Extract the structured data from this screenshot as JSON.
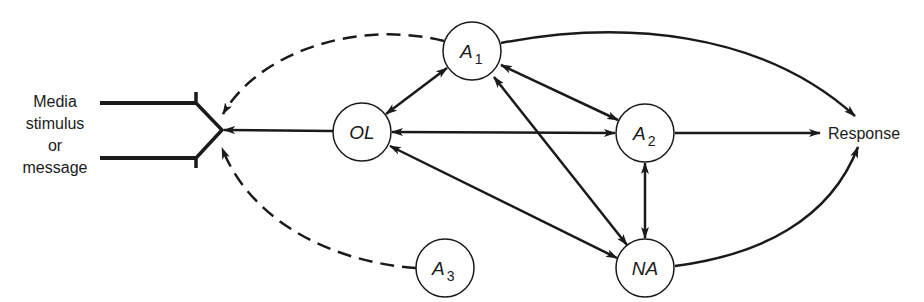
{
  "diagram": {
    "input": {
      "lines": [
        "Media",
        "stimulus",
        "or",
        "message"
      ]
    },
    "output": {
      "label": "Response"
    },
    "nodes": {
      "A1": {
        "main": "A",
        "sub": "1"
      },
      "OL": {
        "main": "OL",
        "sub": ""
      },
      "A2": {
        "main": "A",
        "sub": "2"
      },
      "NA": {
        "main": "NA",
        "sub": ""
      },
      "A3": {
        "main": "A",
        "sub": "3"
      }
    },
    "edges": [
      {
        "from": "A1",
        "to": "message",
        "style": "dashed",
        "direction": "forward"
      },
      {
        "from": "A3",
        "to": "message",
        "style": "dashed",
        "direction": "forward"
      },
      {
        "from": "OL",
        "to": "message",
        "style": "solid",
        "direction": "forward"
      },
      {
        "from": "OL",
        "to": "A1",
        "style": "solid",
        "direction": "both"
      },
      {
        "from": "OL",
        "to": "A2",
        "style": "solid",
        "direction": "both"
      },
      {
        "from": "OL",
        "to": "NA",
        "style": "solid",
        "direction": "both"
      },
      {
        "from": "A1",
        "to": "A2",
        "style": "solid",
        "direction": "both"
      },
      {
        "from": "A1",
        "to": "NA",
        "style": "solid",
        "direction": "both"
      },
      {
        "from": "A2",
        "to": "NA",
        "style": "solid",
        "direction": "both"
      },
      {
        "from": "A1",
        "to": "Response",
        "style": "solid",
        "direction": "forward"
      },
      {
        "from": "A2",
        "to": "Response",
        "style": "solid",
        "direction": "forward"
      },
      {
        "from": "NA",
        "to": "Response",
        "style": "solid",
        "direction": "forward"
      }
    ],
    "colors": {
      "ink": "#1a1a1a",
      "background": "#ffffff"
    }
  }
}
